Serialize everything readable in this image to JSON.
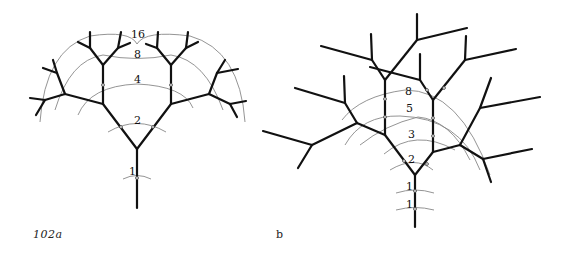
{
  "figure": {
    "caption_a": "102a",
    "caption_b": "b"
  },
  "tree_a": {
    "description": "Symmetric dichotomous branching tree with concentric level arcs",
    "level_labels": [
      "1",
      "2",
      "4",
      "8",
      "16"
    ]
  },
  "tree_b": {
    "description": "Asymmetric Fibonacci-type branching tree with concentric level arcs",
    "level_labels": [
      "1",
      "1",
      "2",
      "3",
      "5",
      "8"
    ]
  }
}
